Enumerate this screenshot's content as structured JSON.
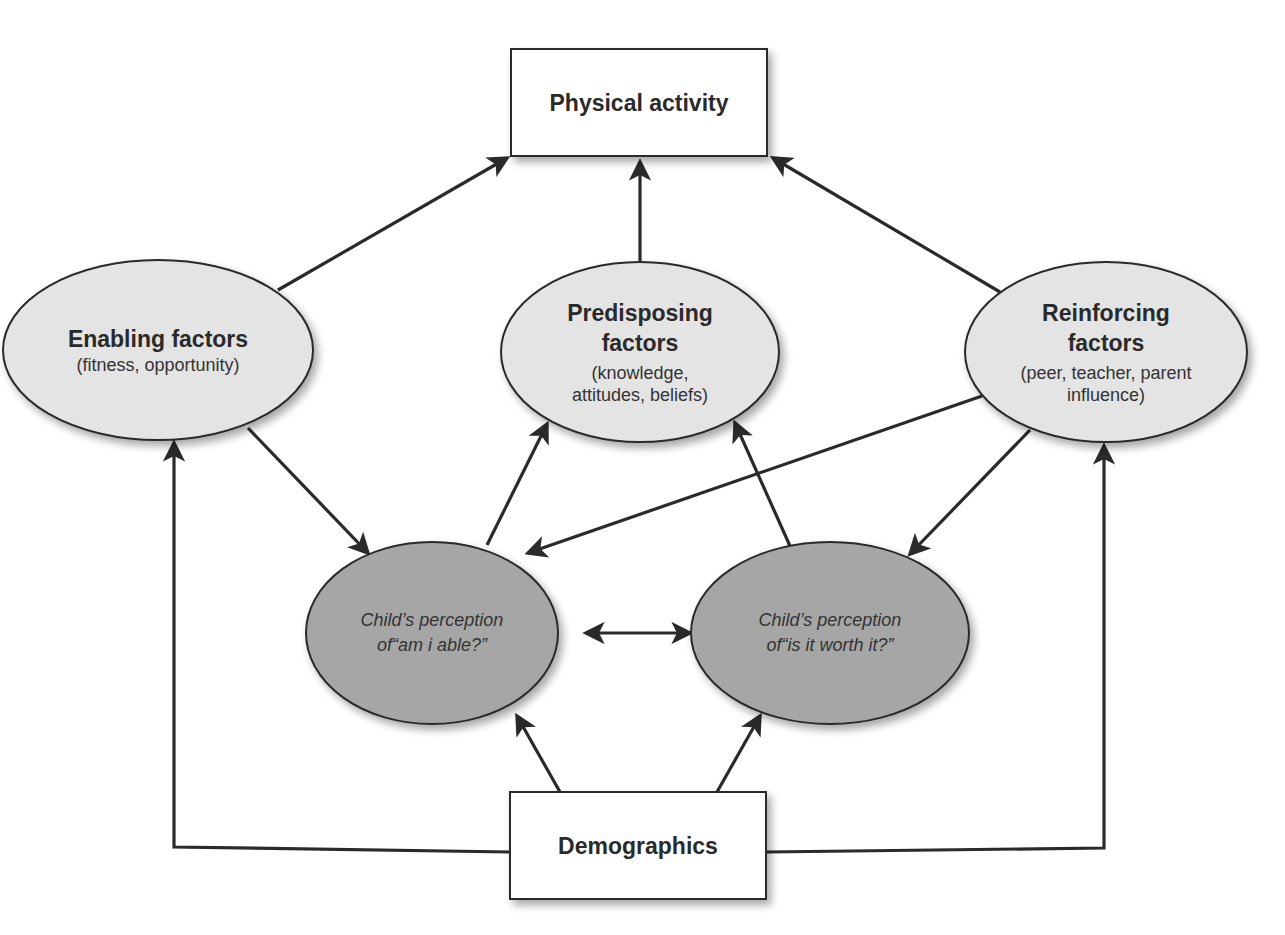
{
  "diagram": {
    "colors": {
      "background": "#ffffff",
      "light_ellipse_fill": "#e4e4e4",
      "dark_ellipse_fill": "#a6a6a6",
      "stroke": "#2a2a2a",
      "box_fill": "#ffffff"
    },
    "nodes": {
      "physical_activity": {
        "title": "Physical activity"
      },
      "enabling": {
        "title": "Enabling factors",
        "subtitle": "(fitness, opportunity)"
      },
      "predisposing": {
        "title_line1": "Predisposing",
        "title_line2": "factors",
        "subtitle_line1": "(knowledge,",
        "subtitle_line2": "attitudes, beliefs)"
      },
      "reinforcing": {
        "title_line1": "Reinforcing",
        "title_line2": "factors",
        "subtitle_line1": "(peer, teacher, parent",
        "subtitle_line2": "influence)"
      },
      "able": {
        "line1": "Child’s perception",
        "line2": "of“am i able?”"
      },
      "worth": {
        "line1": "Child’s perception",
        "line2": "of“is it worth it?”"
      },
      "demographics": {
        "title": "Demographics"
      }
    },
    "edges": [
      {
        "from": "enabling",
        "to": "physical_activity"
      },
      {
        "from": "predisposing",
        "to": "physical_activity"
      },
      {
        "from": "reinforcing",
        "to": "physical_activity"
      },
      {
        "from": "enabling",
        "to": "able"
      },
      {
        "from": "able",
        "to": "predisposing"
      },
      {
        "from": "worth",
        "to": "predisposing"
      },
      {
        "from": "reinforcing",
        "to": "able"
      },
      {
        "from": "reinforcing",
        "to": "worth"
      },
      {
        "from": "able",
        "to": "worth",
        "bidirectional": true
      },
      {
        "from": "demographics",
        "to": "able"
      },
      {
        "from": "demographics",
        "to": "worth"
      },
      {
        "from": "demographics",
        "to": "enabling"
      },
      {
        "from": "demographics",
        "to": "reinforcing"
      }
    ]
  }
}
